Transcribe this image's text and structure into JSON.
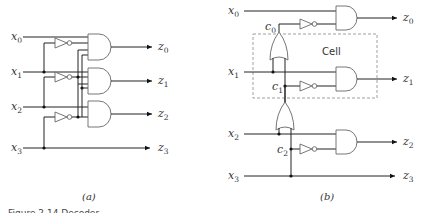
{
  "panel_a": {
    "caption": "(a)",
    "inputs": [
      {
        "name": "x",
        "sub": "0"
      },
      {
        "name": "x",
        "sub": "1"
      },
      {
        "name": "x",
        "sub": "2"
      },
      {
        "name": "x",
        "sub": "3"
      }
    ],
    "outputs": [
      {
        "name": "z",
        "sub": "0"
      },
      {
        "name": "z",
        "sub": "1"
      },
      {
        "name": "z",
        "sub": "2"
      },
      {
        "name": "z",
        "sub": "3"
      }
    ]
  },
  "panel_b": {
    "caption": "(b)",
    "cell_label": "Cell",
    "inputs": [
      {
        "name": "x",
        "sub": "0"
      },
      {
        "name": "x",
        "sub": "1"
      },
      {
        "name": "x",
        "sub": "2"
      },
      {
        "name": "x",
        "sub": "3"
      }
    ],
    "outputs": [
      {
        "name": "z",
        "sub": "0"
      },
      {
        "name": "z",
        "sub": "1"
      },
      {
        "name": "z",
        "sub": "2"
      },
      {
        "name": "z",
        "sub": "3"
      }
    ],
    "carries": [
      {
        "name": "c",
        "sub": "0"
      },
      {
        "name": "c",
        "sub": "1"
      },
      {
        "name": "c",
        "sub": "2"
      }
    ]
  },
  "figure_caption": "Figure 2.14 Decoder..."
}
